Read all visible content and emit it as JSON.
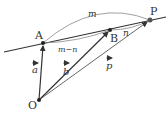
{
  "diagram": {
    "points": {
      "O": "O",
      "A": "A",
      "B": "B",
      "P": "P"
    },
    "vectors": {
      "a": "a",
      "b": "b",
      "p": "p"
    },
    "arcs": {
      "m": "m",
      "m_minus_n": "m−n",
      "n": "n"
    },
    "colors": {
      "line": "#333333",
      "arc": "#777777",
      "text": "#333333"
    }
  }
}
